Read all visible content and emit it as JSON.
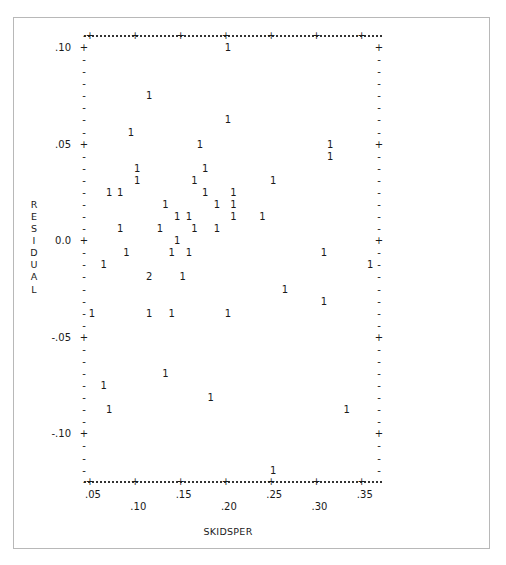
{
  "chart_data": {
    "type": "scatter",
    "title": "",
    "xlabel": "SKIDSPER",
    "ylabel": "RESIDUAL",
    "xlim": [
      0.0465,
      0.3625
    ],
    "ylim": [
      -0.125,
      0.1045
    ],
    "x_ticks": [
      ".05",
      ".10",
      ".15",
      ".20",
      ".25",
      ".30",
      ".35"
    ],
    "x_tick_values": [
      0.05,
      0.1,
      0.15,
      0.2,
      0.25,
      0.3,
      0.35
    ],
    "y_ticks": [
      ".10",
      ".05",
      "0.0",
      "-.05",
      "-.10"
    ],
    "y_tick_values": [
      0.1,
      0.05,
      0.0,
      -0.05,
      -0.1
    ],
    "grid": false,
    "legend": "none (symbols show count of observations at each position)",
    "points": [
      {
        "x": 0.2,
        "y": 0.1,
        "n": "1"
      },
      {
        "x": 0.113,
        "y": 0.075,
        "n": "1"
      },
      {
        "x": 0.2,
        "y": 0.0625,
        "n": "1"
      },
      {
        "x": 0.093,
        "y": 0.05625,
        "n": "1"
      },
      {
        "x": 0.169,
        "y": 0.05,
        "n": "1"
      },
      {
        "x": 0.313,
        "y": 0.05,
        "n": "1"
      },
      {
        "x": 0.313,
        "y": 0.04375,
        "n": "1"
      },
      {
        "x": 0.1,
        "y": 0.0375,
        "n": "1"
      },
      {
        "x": 0.175,
        "y": 0.0375,
        "n": "1"
      },
      {
        "x": 0.1,
        "y": 0.03125,
        "n": "1"
      },
      {
        "x": 0.163,
        "y": 0.03125,
        "n": "1"
      },
      {
        "x": 0.25,
        "y": 0.03125,
        "n": "1"
      },
      {
        "x": 0.069,
        "y": 0.025,
        "n": "1"
      },
      {
        "x": 0.081,
        "y": 0.025,
        "n": "1"
      },
      {
        "x": 0.175,
        "y": 0.025,
        "n": "1"
      },
      {
        "x": 0.206,
        "y": 0.025,
        "n": "1"
      },
      {
        "x": 0.131,
        "y": 0.01875,
        "n": "1"
      },
      {
        "x": 0.188,
        "y": 0.01875,
        "n": "1"
      },
      {
        "x": 0.206,
        "y": 0.01875,
        "n": "1"
      },
      {
        "x": 0.144,
        "y": 0.0125,
        "n": "1"
      },
      {
        "x": 0.157,
        "y": 0.0125,
        "n": "1"
      },
      {
        "x": 0.206,
        "y": 0.0125,
        "n": "1"
      },
      {
        "x": 0.238,
        "y": 0.0125,
        "n": "1"
      },
      {
        "x": 0.081,
        "y": 0.00625,
        "n": "1"
      },
      {
        "x": 0.125,
        "y": 0.00625,
        "n": "1"
      },
      {
        "x": 0.163,
        "y": 0.00625,
        "n": "1"
      },
      {
        "x": 0.188,
        "y": 0.00625,
        "n": "1"
      },
      {
        "x": 0.144,
        "y": 0.0,
        "n": "1"
      },
      {
        "x": 0.088,
        "y": -0.00625,
        "n": "1"
      },
      {
        "x": 0.138,
        "y": -0.00625,
        "n": "1"
      },
      {
        "x": 0.157,
        "y": -0.00625,
        "n": "1"
      },
      {
        "x": 0.306,
        "y": -0.00625,
        "n": "1"
      },
      {
        "x": 0.063,
        "y": -0.0125,
        "n": "1"
      },
      {
        "x": 0.357,
        "y": -0.0125,
        "n": "1"
      },
      {
        "x": 0.113,
        "y": -0.01875,
        "n": "2"
      },
      {
        "x": 0.15,
        "y": -0.01875,
        "n": "1"
      },
      {
        "x": 0.263,
        "y": -0.025,
        "n": "1"
      },
      {
        "x": 0.306,
        "y": -0.03125,
        "n": "1"
      },
      {
        "x": 0.05,
        "y": -0.0375,
        "n": "1"
      },
      {
        "x": 0.113,
        "y": -0.0375,
        "n": "1"
      },
      {
        "x": 0.138,
        "y": -0.0375,
        "n": "1"
      },
      {
        "x": 0.2,
        "y": -0.0375,
        "n": "1"
      },
      {
        "x": 0.131,
        "y": -0.06875,
        "n": "1"
      },
      {
        "x": 0.063,
        "y": -0.075,
        "n": "1"
      },
      {
        "x": 0.181,
        "y": -0.08125,
        "n": "1"
      },
      {
        "x": 0.069,
        "y": -0.0875,
        "n": "1"
      },
      {
        "x": 0.331,
        "y": -0.0875,
        "n": "1"
      },
      {
        "x": 0.25,
        "y": -0.11875,
        "n": "1"
      }
    ]
  },
  "axes": {
    "xlabel": "SKIDSPER",
    "ylabel_letters": [
      "R",
      "E",
      "S",
      "I",
      "D",
      "U",
      "A",
      "L"
    ],
    "x_ticks_upper": [
      ".05",
      ".15",
      ".25",
      ".35"
    ],
    "x_ticks_lower": [
      ".10",
      ".20",
      ".30"
    ],
    "y_ticks": [
      ".10",
      ".05",
      "0.0",
      "-.05",
      "-.10"
    ]
  },
  "colors": {
    "ink": "#1a1a1a",
    "frame": "#b8b8b8",
    "background": "#ffffff"
  }
}
